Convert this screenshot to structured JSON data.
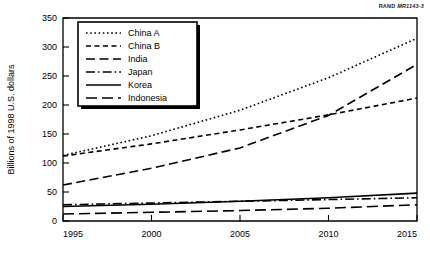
{
  "figure": {
    "source_tag_prefix": "RAND",
    "source_tag_id": "MR1143-3"
  },
  "chart_data": {
    "type": "line",
    "title": "",
    "xlabel": "",
    "ylabel": "Billions of 1998 U.S. dollars",
    "xlim": [
      1995,
      2015
    ],
    "ylim": [
      0,
      350
    ],
    "xticks": [
      1995,
      2000,
      2005,
      2010,
      2015
    ],
    "xticklabels": [
      "1995",
      "2000",
      "2005",
      "2010",
      "2015"
    ],
    "yticks": [
      0,
      50,
      100,
      150,
      200,
      250,
      300,
      350
    ],
    "yticklabels": [
      "0",
      "50",
      "100",
      "150",
      "200",
      "250",
      "300",
      "350"
    ],
    "grid": false,
    "legend_position": "upper left",
    "x": [
      1995,
      2000,
      2005,
      2010,
      2015
    ],
    "series": [
      {
        "name": "China A",
        "style": "dotted",
        "dash": "1.6,2.6",
        "values": [
          113,
          147,
          191,
          247,
          315
        ]
      },
      {
        "name": "China B",
        "style": "dashed-short",
        "dash": "5,3.5",
        "values": [
          112,
          133,
          157,
          183,
          212
        ]
      },
      {
        "name": "India",
        "style": "dashed-long",
        "dash": "9,4.5",
        "values": [
          62,
          91,
          126,
          182,
          270
        ]
      },
      {
        "name": "Japan",
        "style": "dash-dot",
        "dash": "9,3,1.6,3",
        "values": [
          28,
          31,
          34,
          37,
          40
        ]
      },
      {
        "name": "Korea",
        "style": "solid",
        "dash": "",
        "values": [
          25,
          29,
          34,
          40,
          48
        ]
      },
      {
        "name": "Indonesia",
        "style": "dashed-verylong",
        "dash": "11,5",
        "values": [
          12,
          15,
          18,
          22,
          28
        ]
      }
    ]
  }
}
